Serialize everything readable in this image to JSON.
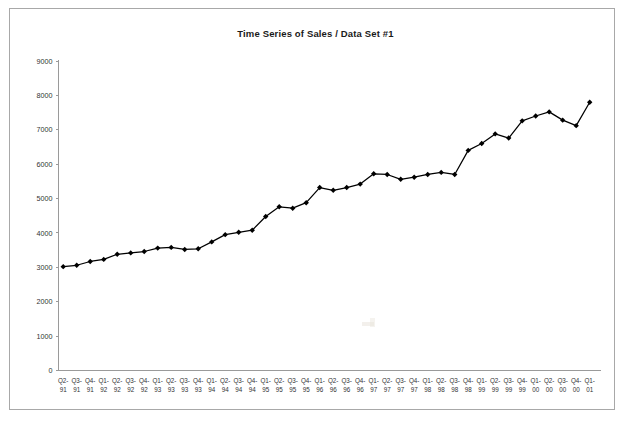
{
  "window": {
    "background_color": "#ffffff",
    "frame_color": "#a8a8a8"
  },
  "chart": {
    "title": "Time Series of Sales / Data Set #1",
    "series_color": "#000000",
    "axis_color": "#9a9a9a"
  },
  "chart_data": {
    "type": "line",
    "title": "Time Series of Sales / Data Set #1",
    "xlabel": "",
    "ylabel": "",
    "ylim": [
      0,
      9000
    ],
    "ytick_step": 1000,
    "yticks": [
      0,
      1000,
      2000,
      3000,
      4000,
      5000,
      6000,
      7000,
      8000,
      9000
    ],
    "ytick_labels": [
      "0",
      "1000",
      "2000",
      "3000",
      "4000",
      "5000",
      "6000",
      "7000",
      "8000",
      "9000"
    ],
    "grid": false,
    "legend": false,
    "markers": "diamond",
    "categories": [
      "Q2-91",
      "Q3-91",
      "Q4-91",
      "Q1-92",
      "Q2-92",
      "Q3-92",
      "Q4-92",
      "Q1-93",
      "Q2-93",
      "Q3-93",
      "Q4-93",
      "Q1-94",
      "Q2-94",
      "Q3-94",
      "Q4-94",
      "Q1-95",
      "Q2-95",
      "Q3-95",
      "Q4-95",
      "Q1-96",
      "Q2-96",
      "Q3-96",
      "Q4-96",
      "Q1-97",
      "Q2-97",
      "Q3-97",
      "Q4-97",
      "Q1-98",
      "Q2-98",
      "Q3-98",
      "Q4-98",
      "Q1-99",
      "Q2-99",
      "Q3-99",
      "Q4-99",
      "Q1-00",
      "Q2-00",
      "Q3-00",
      "Q4-00",
      "Q1-01"
    ],
    "categories_top": [
      "Q2-",
      "Q3-",
      "Q4-",
      "Q1-",
      "Q2-",
      "Q3-",
      "Q4-",
      "Q1-",
      "Q2-",
      "Q3-",
      "Q4-",
      "Q1-",
      "Q2-",
      "Q3-",
      "Q4-",
      "Q1-",
      "Q2-",
      "Q3-",
      "Q4-",
      "Q1-",
      "Q2-",
      "Q3-",
      "Q4-",
      "Q1-",
      "Q2-",
      "Q3-",
      "Q4-",
      "Q1-",
      "Q2-",
      "Q3-",
      "Q4-",
      "Q1-",
      "Q2-",
      "Q3-",
      "Q4-",
      "Q1-",
      "Q2-",
      "Q3-",
      "Q4-",
      "Q1-"
    ],
    "categories_bottom": [
      "91",
      "91",
      "91",
      "92",
      "92",
      "92",
      "92",
      "93",
      "93",
      "93",
      "93",
      "94",
      "94",
      "94",
      "94",
      "95",
      "95",
      "95",
      "95",
      "96",
      "96",
      "96",
      "96",
      "97",
      "97",
      "97",
      "97",
      "98",
      "98",
      "98",
      "98",
      "99",
      "99",
      "99",
      "99",
      "00",
      "00",
      "00",
      "00",
      "01"
    ],
    "values": [
      3020,
      3060,
      3170,
      3230,
      3380,
      3420,
      3460,
      3560,
      3580,
      3520,
      3540,
      3740,
      3950,
      4020,
      4080,
      4480,
      4760,
      4720,
      4880,
      5320,
      5240,
      5320,
      5420,
      5720,
      5700,
      5560,
      5620,
      5700,
      5760,
      5700,
      6400,
      6600,
      6880,
      6760,
      7260,
      7400,
      7520,
      7280,
      7120,
      7800
    ]
  }
}
